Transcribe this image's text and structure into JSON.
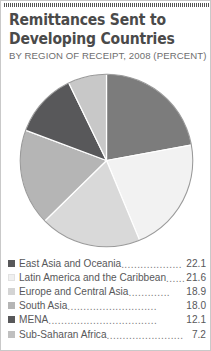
{
  "card": {
    "title": "Remittances Sent to\nDeveloping Countries",
    "subtitle": "BY REGION OF RECEIPT, 2008 (PERCENT)"
  },
  "chart_data": {
    "type": "pie",
    "title": "Remittances Sent to Developing Countries",
    "subtitle": "BY REGION OF RECEIPT, 2008 (PERCENT)",
    "unit": "percent",
    "legend_position": "bottom",
    "start_angle_deg": 0,
    "direction": "clockwise",
    "categories": [
      "East Asia and Oceania",
      "Latin America and the Caribbean",
      "Europe and Central Asia",
      "South Asia",
      "MENA",
      "Sub-Saharan Africa"
    ],
    "values": [
      22.1,
      21.6,
      18.9,
      18.0,
      12.1,
      7.2
    ],
    "value_labels": [
      "22.1",
      "21.6",
      "18.9",
      "18.0",
      "12.1",
      "7.2"
    ],
    "colors": [
      "#7c7c7c",
      "#f2f2f2",
      "#d9d9d9",
      "#b5b5b5",
      "#58585a",
      "#c8c8c8"
    ],
    "slices": [
      {
        "label": "East Asia and Oceania",
        "value": 22.1,
        "color": "#7c7c7c"
      },
      {
        "label": "Latin America and the Caribbean",
        "value": 21.6,
        "color": "#f2f2f2"
      },
      {
        "label": "Europe and Central Asia",
        "value": 18.9,
        "color": "#d9d9d9"
      },
      {
        "label": "South Asia",
        "value": 18.0,
        "color": "#b5b5b5"
      },
      {
        "label": "MENA",
        "value": 12.1,
        "color": "#58585a"
      },
      {
        "label": "Sub-Saharan Africa",
        "value": 7.2,
        "color": "#c8c8c8"
      }
    ]
  },
  "legend": {
    "rows": [
      {
        "label": "East Asia and Oceania",
        "value": "22.1",
        "dots": "...................",
        "color": "#58585a"
      },
      {
        "label": "Latin America and the Caribbean",
        "value": "21.6",
        "dots": "......",
        "color": "#f0f0f0"
      },
      {
        "label": "Europe and Central Asia",
        "value": "18.9",
        "dots": ".............",
        "color": "#d4d4d4"
      },
      {
        "label": "South Asia",
        "value": "18.0",
        "dots": "............................",
        "color": "#b5b5b5"
      },
      {
        "label": "MENA",
        "value": "12.1",
        "dots": "..................................",
        "color": "#58585a"
      },
      {
        "label": "Sub-Saharan Africa",
        "value": "7.2",
        "dots": " ........................",
        "color": "#c0c0c0"
      }
    ]
  }
}
